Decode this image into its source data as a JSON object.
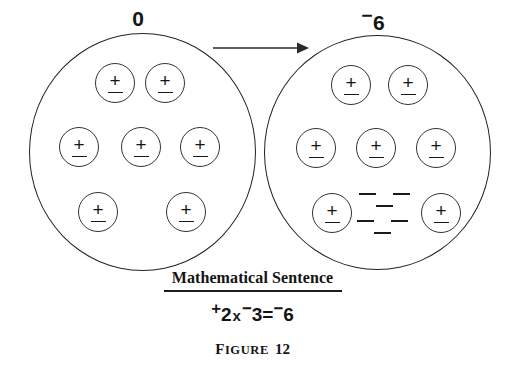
{
  "figure": {
    "caption_word_first": "F",
    "caption_word_rest": "IGURE",
    "caption_number": "12"
  },
  "sets": {
    "left": {
      "label_sign": "",
      "label_value": "0",
      "token_count": 7,
      "loose_minus_count": 0,
      "rows": [
        2,
        3,
        2
      ]
    },
    "right": {
      "label_sign": "−",
      "label_value": "6",
      "token_count": 7,
      "loose_minus_count": 6,
      "rows": [
        2,
        3,
        2
      ],
      "minus_clusters": 2,
      "minus_per_cluster": 3
    }
  },
  "arrow": {
    "direction": "right",
    "name": "transform-arrow"
  },
  "token": {
    "plus_glyph": "+",
    "minus_glyph": "−",
    "meaning": "plus-minus pair"
  },
  "sentence": {
    "title": "Mathematical Sentence",
    "equation": {
      "left_sign": "−",
      "full_text": "+2 x -3 = -6",
      "term1_sign": "+",
      "term1_value": "2",
      "operator": "x",
      "term2_sign": "−",
      "term2_value": "3",
      "equals": "=",
      "result_sign": "−",
      "result_value": "6"
    }
  },
  "colors": {
    "ink": "#1a1a1a",
    "background": "#ffffff",
    "stroke": "#222222"
  }
}
